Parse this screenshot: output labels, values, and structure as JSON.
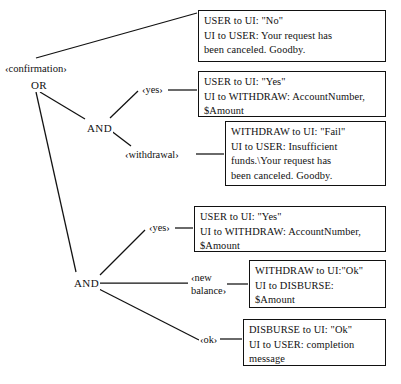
{
  "diagram": {
    "type": "and-or-decomposition-tree",
    "root": {
      "label": "‹confirmation›",
      "operator": "OR"
    },
    "nodes": [
      {
        "id": "confirmation",
        "label": "‹confirmation›",
        "x": 4,
        "y": 62
      },
      {
        "id": "or-root",
        "label": "OR",
        "x": 30,
        "y": 79
      },
      {
        "id": "and-upper",
        "label": "AND",
        "x": 86,
        "y": 122
      },
      {
        "id": "and-lower",
        "label": "AND",
        "x": 73,
        "y": 277
      }
    ],
    "arg_labels": [
      {
        "id": "yes-upper",
        "label": "‹yes›",
        "x": 141,
        "y": 84
      },
      {
        "id": "withdrawal",
        "label": "‹withdrawal›",
        "x": 124,
        "y": 149
      },
      {
        "id": "yes-lower",
        "label": "‹yes›",
        "x": 148,
        "y": 222
      },
      {
        "id": "new-balance",
        "label": "‹new\nbalance›",
        "x": 190,
        "y": 272
      },
      {
        "id": "ok",
        "label": "‹ok›",
        "x": 199,
        "y": 334
      }
    ],
    "boxes": [
      {
        "id": "box-no-cancel",
        "text": "USER to UI: \"No\"\nUI to USER: Your request has\nbeen canceled.  Goodby.",
        "x": 198,
        "y": 10,
        "w": 188,
        "h": 52
      },
      {
        "id": "box-yes-withdraw-upper",
        "text": "USER to UI: \"Yes\"\nUI to WITHDRAW: AccountNumber,\n$Amount",
        "x": 198,
        "y": 71,
        "w": 188,
        "h": 46
      },
      {
        "id": "box-withdraw-fail",
        "text": "WITHDRAW to UI: \"Fail\"\nUI to USER: Insufficient\nfunds.\\Your request has\nbeen canceled.  Goodby.",
        "x": 225,
        "y": 121,
        "w": 161,
        "h": 65
      },
      {
        "id": "box-yes-withdraw-lower",
        "text": "USER to UI: \"Yes\"\nUI to WITHDRAW: AccountNumber,\n$Amount",
        "x": 194,
        "y": 206,
        "w": 192,
        "h": 46
      },
      {
        "id": "box-withdraw-ok-disburse",
        "text": "WITHDRAW to UI:\"Ok\"\nUI  to DISBURSE:\n$Amount",
        "x": 249,
        "y": 260,
        "w": 137,
        "h": 48
      },
      {
        "id": "box-disburse-ok",
        "text": "DISBURSE to UI: \"Ok\"\nUI to USER: completion\nmessage",
        "x": 243,
        "y": 319,
        "w": 143,
        "h": 47
      }
    ],
    "edges": [
      {
        "id": "edge-confirmation-to-no",
        "x1": 36,
        "y1": 58,
        "x2": 197,
        "y2": 13
      },
      {
        "id": "edge-or-to-and-upper",
        "x1": 40,
        "y1": 92,
        "x2": 85,
        "y2": 119
      },
      {
        "id": "edge-or-to-and-lower",
        "x1": 36,
        "y1": 92,
        "x2": 76,
        "y2": 272
      },
      {
        "id": "edge-and-upper-to-yes",
        "x1": 110,
        "y1": 118,
        "x2": 138,
        "y2": 91
      },
      {
        "id": "edge-yes-upper-to-box",
        "x1": 168,
        "y1": 90,
        "x2": 197,
        "y2": 90
      },
      {
        "id": "edge-and-upper-to-withdrawal",
        "x1": 110,
        "y1": 130,
        "x2": 131,
        "y2": 146
      },
      {
        "id": "edge-withdrawal-to-box",
        "x1": 196,
        "y1": 154,
        "x2": 224,
        "y2": 154
      },
      {
        "id": "edge-and-lower-to-yes",
        "x1": 100,
        "y1": 275,
        "x2": 145,
        "y2": 230
      },
      {
        "id": "edge-yes-lower-to-box",
        "x1": 175,
        "y1": 228,
        "x2": 193,
        "y2": 228
      },
      {
        "id": "edge-and-lower-to-newbalance",
        "x1": 100,
        "y1": 283,
        "x2": 188,
        "y2": 283
      },
      {
        "id": "edge-newbalance-to-box",
        "x1": 226,
        "y1": 284,
        "x2": 248,
        "y2": 284
      },
      {
        "id": "edge-and-lower-to-ok",
        "x1": 97,
        "y1": 288,
        "x2": 199,
        "y2": 340
      },
      {
        "id": "edge-ok-to-box",
        "x1": 220,
        "y1": 339,
        "x2": 242,
        "y2": 339
      }
    ]
  }
}
